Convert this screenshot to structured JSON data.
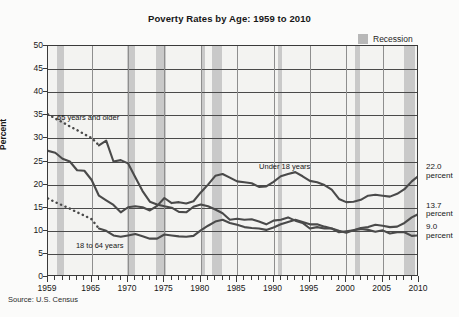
{
  "chart_data": {
    "type": "line",
    "title": "Poverty Rates by Age: 1959 to 2010",
    "xlabel": "",
    "ylabel": "Percent",
    "xlim": [
      1959,
      2010
    ],
    "ylim": [
      0,
      50
    ],
    "ytick_values": [
      0,
      5,
      10,
      15,
      20,
      25,
      30,
      35,
      40,
      45,
      50
    ],
    "ytick_labels": [
      "0",
      "5",
      "10",
      "15",
      "20",
      "25",
      "30",
      "35",
      "40",
      "45",
      "50"
    ],
    "xtick_values": [
      1959,
      1965,
      1970,
      1975,
      1980,
      1985,
      1990,
      1995,
      2000,
      2005,
      2010
    ],
    "xtick_labels": [
      "1959",
      "1965",
      "1970",
      "1975",
      "1980",
      "1985",
      "1990",
      "1995",
      "2000",
      "2005",
      "2010"
    ],
    "minor_xticks": "every year",
    "grid": "horizontal gridlines at every 5 percent; vertical gridlines at every 5 years",
    "legend_position": "top-right",
    "legend": [
      {
        "label": "Recession",
        "color": "#c6c6c6",
        "marker": "shaded band"
      }
    ],
    "annotations": [
      {
        "text": "65 years and older",
        "x": 1964.5,
        "y": 34.2
      },
      {
        "text": "Under 18 years",
        "x": 1992.0,
        "y": 23.6
      },
      {
        "text": "18 to 64 years",
        "x": 1966.0,
        "y": 6.6
      },
      {
        "text": "22.0 percent",
        "x": 2010,
        "y": 22.0
      },
      {
        "text": "13.7 percent",
        "x": 2010,
        "y": 13.7
      },
      {
        "text": "9.0 percent",
        "x": 2010,
        "y": 9.0
      }
    ],
    "end_labels": [
      {
        "value": "22.0",
        "unit": "percent",
        "series": "Under 18 years"
      },
      {
        "value": "13.7",
        "unit": "percent",
        "series": "18 to 64 years"
      },
      {
        "value": "9.0",
        "unit": "percent",
        "series": "65 years and older"
      }
    ],
    "recession_bands": [
      {
        "start": 1960.3,
        "end": 1961.2
      },
      {
        "start": 1969.9,
        "end": 1970.9
      },
      {
        "start": 1973.9,
        "end": 1975.2
      },
      {
        "start": 1980.1,
        "end": 1980.6
      },
      {
        "start": 1981.6,
        "end": 1982.9
      },
      {
        "start": 1990.6,
        "end": 1991.2
      },
      {
        "start": 2001.2,
        "end": 2001.9
      },
      {
        "start": 2007.9,
        "end": 2009.5
      }
    ],
    "series": [
      {
        "name": "65 years and older",
        "color": "#4a4a4a",
        "style_segments": [
          {
            "from": 1959,
            "to": 1966,
            "style": "dashed",
            "note": "interpolated / not annual"
          },
          {
            "from": 1966,
            "to": 2010,
            "style": "solid"
          }
        ],
        "x": [
          1959,
          1960,
          1961,
          1962,
          1963,
          1964,
          1965,
          1966,
          1967,
          1968,
          1969,
          1970,
          1971,
          1972,
          1973,
          1974,
          1975,
          1976,
          1977,
          1978,
          1979,
          1980,
          1981,
          1982,
          1983,
          1984,
          1985,
          1986,
          1987,
          1988,
          1989,
          1990,
          1991,
          1992,
          1993,
          1994,
          1995,
          1996,
          1997,
          1998,
          1999,
          2000,
          2001,
          2002,
          2003,
          2004,
          2005,
          2006,
          2007,
          2008,
          2009,
          2010
        ],
        "y": [
          35.2,
          34.3,
          33.5,
          32.6,
          31.8,
          30.9,
          30.1,
          28.5,
          29.5,
          25.0,
          25.3,
          24.6,
          21.6,
          18.6,
          16.3,
          15.7,
          15.3,
          15.0,
          14.1,
          14.0,
          15.2,
          15.7,
          15.3,
          14.6,
          13.8,
          12.4,
          12.6,
          12.4,
          12.5,
          12.0,
          11.4,
          12.2,
          12.4,
          12.9,
          12.2,
          11.7,
          10.5,
          10.8,
          10.5,
          10.5,
          9.7,
          9.9,
          10.1,
          10.4,
          10.2,
          9.8,
          10.1,
          9.4,
          9.7,
          9.7,
          8.9,
          9.0
        ]
      },
      {
        "name": "Under 18 years",
        "color": "#4a4a4a",
        "style_segments": [
          {
            "from": 1959,
            "to": 2010,
            "style": "solid"
          }
        ],
        "x": [
          1959,
          1960,
          1961,
          1962,
          1963,
          1964,
          1965,
          1966,
          1967,
          1968,
          1969,
          1970,
          1971,
          1972,
          1973,
          1974,
          1975,
          1976,
          1977,
          1978,
          1979,
          1980,
          1981,
          1982,
          1983,
          1984,
          1985,
          1986,
          1987,
          1988,
          1989,
          1990,
          1991,
          1992,
          1993,
          1994,
          1995,
          1996,
          1997,
          1998,
          1999,
          2000,
          2001,
          2002,
          2003,
          2004,
          2005,
          2006,
          2007,
          2008,
          2009,
          2010
        ],
        "y": [
          27.3,
          26.9,
          25.6,
          25.0,
          23.1,
          23.0,
          21.0,
          17.6,
          16.6,
          15.6,
          14.0,
          15.1,
          15.3,
          15.1,
          14.4,
          15.4,
          17.1,
          16.0,
          16.2,
          15.9,
          16.4,
          18.3,
          20.0,
          21.9,
          22.3,
          21.5,
          20.7,
          20.5,
          20.3,
          19.5,
          19.6,
          20.6,
          21.8,
          22.3,
          22.7,
          21.8,
          20.8,
          20.5,
          19.9,
          18.9,
          16.9,
          16.2,
          16.3,
          16.7,
          17.6,
          17.8,
          17.6,
          17.4,
          18.0,
          19.0,
          20.7,
          22.0
        ]
      },
      {
        "name": "18 to 64 years",
        "color": "#4a4a4a",
        "style_segments": [
          {
            "from": 1959,
            "to": 1966,
            "style": "dashed",
            "note": "interpolated / not annual"
          },
          {
            "from": 1966,
            "to": 2010,
            "style": "solid"
          }
        ],
        "x": [
          1959,
          1960,
          1961,
          1962,
          1963,
          1964,
          1965,
          1966,
          1967,
          1968,
          1969,
          1970,
          1971,
          1972,
          1973,
          1974,
          1975,
          1976,
          1977,
          1978,
          1979,
          1980,
          1981,
          1982,
          1983,
          1984,
          1985,
          1986,
          1987,
          1988,
          1989,
          1990,
          1991,
          1992,
          1993,
          1994,
          1995,
          1996,
          1997,
          1998,
          1999,
          2000,
          2001,
          2002,
          2003,
          2004,
          2005,
          2006,
          2007,
          2008,
          2009,
          2010
        ],
        "y": [
          17.0,
          16.2,
          15.5,
          14.8,
          14.0,
          13.3,
          12.5,
          10.5,
          10.0,
          9.0,
          8.7,
          9.0,
          9.3,
          8.8,
          8.3,
          8.3,
          9.2,
          9.0,
          8.8,
          8.7,
          8.9,
          10.1,
          11.1,
          12.0,
          12.4,
          11.7,
          11.3,
          10.8,
          10.6,
          10.5,
          10.2,
          10.7,
          11.4,
          11.9,
          12.4,
          11.9,
          11.4,
          11.4,
          10.9,
          10.5,
          10.0,
          9.6,
          10.1,
          10.6,
          10.8,
          11.3,
          11.1,
          10.8,
          10.9,
          11.7,
          12.9,
          13.7
        ]
      }
    ]
  },
  "source": {
    "text": "Source: U.S. Census"
  }
}
